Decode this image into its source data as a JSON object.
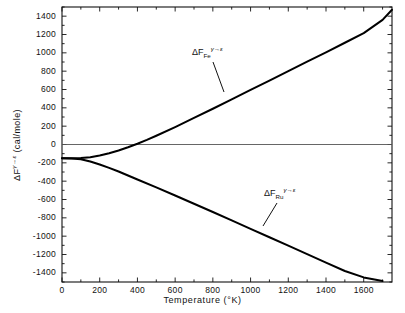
{
  "chart_data": {
    "type": "line",
    "title": "",
    "xlabel": "Temperature (°K)",
    "ylabel": "ΔF^γ→ε (cal/mole)",
    "xlim": [
      0,
      1750
    ],
    "ylim": [
      -1500,
      1500
    ],
    "xticks": [
      0,
      200,
      400,
      600,
      800,
      1000,
      1200,
      1400,
      1600
    ],
    "yticks": [
      1400,
      1200,
      1000,
      800,
      600,
      400,
      200,
      0,
      -200,
      -400,
      -600,
      -800,
      -1000,
      -1200,
      -1400
    ],
    "xtick_labels": [
      "0",
      "200",
      "400",
      "600",
      "800",
      "1000",
      "1200",
      "1400",
      "1600"
    ],
    "ytick_labels": [
      "1400",
      "1200",
      "1000",
      "800",
      "600",
      "400",
      "200",
      "0",
      "-200",
      "-400",
      "-600",
      "-800",
      "-1000",
      "-1200",
      "-1400"
    ],
    "xminor_step": 100,
    "yminor_step": 100,
    "grid": false,
    "legend": "none",
    "zero_reference_line": 0,
    "series": [
      {
        "name": "ΔF_Fe^γ→ε",
        "label_base": "ΔF",
        "label_sub": "Fe",
        "label_sup": "γ→ε",
        "color": "#000000",
        "x": [
          0,
          50,
          100,
          150,
          200,
          250,
          300,
          350,
          400,
          450,
          500,
          600,
          700,
          800,
          900,
          1000,
          1100,
          1200,
          1300,
          1400,
          1500,
          1600,
          1700,
          1750
        ],
        "y": [
          -150,
          -150,
          -148,
          -138,
          -120,
          -95,
          -65,
          -30,
          8,
          50,
          95,
          190,
          290,
          390,
          492,
          595,
          698,
          800,
          903,
          1006,
          1110,
          1215,
          1360,
          1470
        ]
      },
      {
        "name": "ΔF_Ru^γ→ε",
        "label_base": "ΔF",
        "label_sub": "Ru",
        "label_sup": "γ→ε",
        "color": "#000000",
        "x": [
          0,
          50,
          100,
          150,
          200,
          250,
          300,
          350,
          400,
          500,
          600,
          700,
          800,
          900,
          1000,
          1100,
          1200,
          1300,
          1400,
          1500,
          1600,
          1700
        ],
        "y": [
          -150,
          -152,
          -160,
          -185,
          -218,
          -255,
          -295,
          -338,
          -382,
          -468,
          -556,
          -646,
          -736,
          -828,
          -920,
          -1012,
          -1104,
          -1196,
          -1288,
          -1380,
          -1450,
          -1490
        ]
      }
    ],
    "annotations": [
      {
        "name": "fe-curve-label",
        "text_base": "ΔF",
        "text_sub": "Fe",
        "text_sup": "γ→ε",
        "label_x_px": 192,
        "label_y_px": 47,
        "leader_from": [
          213,
          62
        ],
        "leader_to": [
          224,
          92
        ]
      },
      {
        "name": "ru-curve-label",
        "text_base": "ΔF",
        "text_sub": "Ru",
        "text_sup": "γ→ε",
        "label_x_px": 264,
        "label_y_px": 188,
        "leader_from": [
          277,
          203
        ],
        "leader_to": [
          263,
          226
        ]
      }
    ]
  },
  "axes": {
    "x_title": "Temperature (°K)",
    "y_title_base": "ΔF",
    "y_title_sup": "γ→ε",
    "y_title_unit": " (cal/mole)"
  }
}
